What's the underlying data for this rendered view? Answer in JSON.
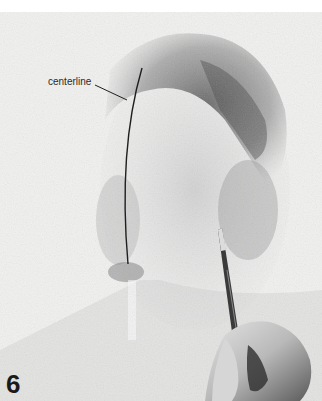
{
  "annotation": {
    "label": "centerline"
  },
  "step": {
    "number": "6"
  },
  "colors": {
    "paper": "#f1f1f0",
    "graphite_dark": "#4a4a4a",
    "graphite_mid": "#8a8a8a",
    "line": "#1f1f1f",
    "skin": "#cfcfcf"
  }
}
